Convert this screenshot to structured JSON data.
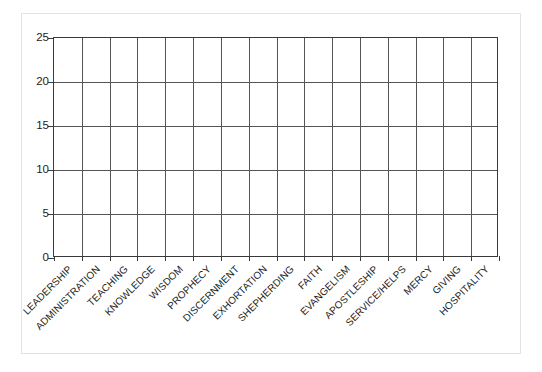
{
  "chart_data": {
    "type": "bar",
    "title": "",
    "subtitle": "",
    "xlabel": "",
    "ylabel": "",
    "categories": [
      "LEADERSHIP",
      "ADMINISTRATION",
      "TEACHING",
      "KNOWLEDGE",
      "WISDOM",
      "PROPHECY",
      "DISCERNMENT",
      "EXHORTATION",
      "SHEPHERDING",
      "FAITH",
      "EVANGELISM",
      "APOSTLESHIP",
      "SERVICE/HELPS",
      "MERCY",
      "GIVING",
      "HOSPITALITY"
    ],
    "values": [
      0,
      0,
      0,
      0,
      0,
      0,
      0,
      0,
      0,
      0,
      0,
      0,
      0,
      0,
      0,
      0
    ],
    "ylim": [
      0,
      25
    ],
    "ytick_labels": [
      "0",
      "5",
      "10",
      "15",
      "20",
      "25"
    ],
    "ytick_values": [
      0,
      5,
      10,
      15,
      20,
      25
    ],
    "grid": "both",
    "legend": "none"
  },
  "colors": {
    "axis": "#3a3a3a",
    "grid": "#555555",
    "text": "#1d1d1d",
    "frame": "#e3e3e3",
    "background": "#ffffff"
  }
}
